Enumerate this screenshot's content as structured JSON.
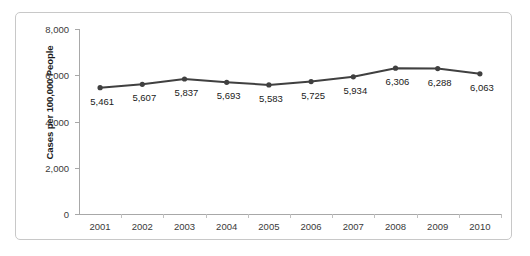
{
  "chart_data": {
    "type": "line",
    "title": "",
    "xlabel": "",
    "ylabel": "Cases per 100,000 People",
    "categories": [
      "2001",
      "2002",
      "2003",
      "2004",
      "2005",
      "2006",
      "2007",
      "2008",
      "2009",
      "2010"
    ],
    "values": [
      5461,
      5607,
      5837,
      5693,
      5583,
      5725,
      5934,
      6306,
      6288,
      6063
    ],
    "value_labels": [
      "5,461",
      "5,607",
      "5,837",
      "5,693",
      "5,583",
      "5,725",
      "5,934",
      "6,306",
      "6,288",
      "6,063"
    ],
    "ylim": [
      0,
      8000
    ],
    "y_ticks": [
      0,
      2000,
      4000,
      6000,
      8000
    ],
    "y_tick_labels": [
      "0",
      "2,000",
      "4,000",
      "6,000",
      "8,000"
    ],
    "grid": false,
    "legend": false,
    "series_color": "#404040",
    "marker": "circle",
    "data_labels_shown": true
  }
}
